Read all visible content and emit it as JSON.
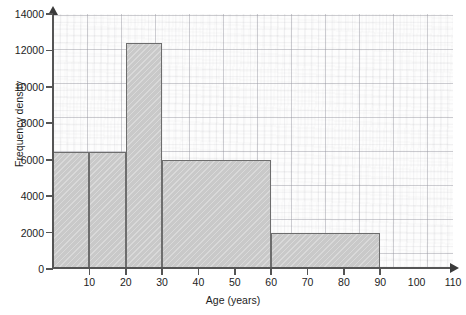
{
  "chart_data": {
    "type": "bar",
    "title": "",
    "xlabel": "Age (years)",
    "ylabel": "Frequency density",
    "xlim": [
      0,
      110
    ],
    "ylim": [
      0,
      14000
    ],
    "grid": true,
    "legend": null,
    "x_ticks": [
      "10",
      "20",
      "30",
      "40",
      "50",
      "60",
      "70",
      "80",
      "90",
      "100",
      "110"
    ],
    "x_tick_values": [
      10,
      20,
      30,
      40,
      50,
      60,
      70,
      80,
      90,
      100,
      110
    ],
    "y_ticks": [
      "0",
      "2000",
      "4000",
      "6000",
      "8000",
      "10000",
      "12000",
      "14000"
    ],
    "y_tick_values": [
      0,
      2000,
      4000,
      6000,
      8000,
      10000,
      12000,
      14000
    ],
    "bars": [
      {
        "label": "0-10",
        "x_start": 0,
        "x_end": 10,
        "value": 6400
      },
      {
        "label": "10-20",
        "x_start": 10,
        "x_end": 20,
        "value": 6400
      },
      {
        "label": "20-30",
        "x_start": 20,
        "x_end": 30,
        "value": 12400
      },
      {
        "label": "30-60",
        "x_start": 30,
        "x_end": 60,
        "value": 6000
      },
      {
        "label": "60-90",
        "x_start": 60,
        "x_end": 90,
        "value": 2000
      }
    ],
    "categories": [
      "0-10",
      "10-20",
      "20-30",
      "30-60",
      "60-90"
    ],
    "values": [
      6400,
      6400,
      12400,
      6000,
      2000
    ],
    "colors": {
      "bar_fill": "#c9c9c9",
      "bar_stroke": "#6d6d6d",
      "axis": "#555555",
      "grid_major": "#96969a",
      "grid_minor": "#afafb9",
      "background": "#fdfdfd",
      "text": "#1d1d1d"
    }
  }
}
